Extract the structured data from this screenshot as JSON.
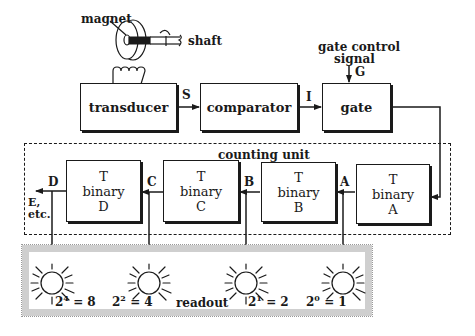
{
  "sensor": {
    "magnet_label": "magnet",
    "shaft_label": "shaft"
  },
  "blocks": {
    "transducer": "transducer",
    "comparator": "comparator",
    "gate": "gate"
  },
  "signals": {
    "s": "S",
    "i": "I",
    "g": "G",
    "gate_control_line1": "gate control",
    "gate_control_line2": "signal"
  },
  "counting_unit": {
    "title": "counting unit",
    "stages": [
      {
        "line1": "T",
        "line2": "binary",
        "line3": "D",
        "output": "D"
      },
      {
        "line1": "T",
        "line2": "binary",
        "line3": "C",
        "output": "C"
      },
      {
        "line1": "T",
        "line2": "binary",
        "line3": "B",
        "output": "B"
      },
      {
        "line1": "T",
        "line2": "binary",
        "line3": "A",
        "output": "A"
      }
    ],
    "overflow_line1": "E,",
    "overflow_line2": "etc."
  },
  "readout": {
    "title": "readout",
    "lamps": [
      {
        "base": "2",
        "exp": "4",
        "value": "= 8"
      },
      {
        "base": "2",
        "exp": "2",
        "value": "= 4"
      },
      {
        "base": "2",
        "exp": "1",
        "value": "= 2"
      },
      {
        "base": "2",
        "exp": "0",
        "value": "= 1"
      }
    ]
  }
}
